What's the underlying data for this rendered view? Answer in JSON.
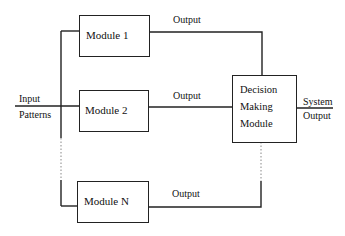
{
  "diagram": {
    "input_label": [
      "Input",
      "Patterns"
    ],
    "modules": [
      {
        "label": "Module 1",
        "output_label": "Output"
      },
      {
        "label": "Module 2",
        "output_label": "Output"
      },
      {
        "label": "Module N",
        "output_label": "Output"
      }
    ],
    "decision_module": {
      "lines": [
        "Decision",
        "Making",
        "Module"
      ]
    },
    "system_output_label": [
      "System",
      "Output"
    ]
  }
}
